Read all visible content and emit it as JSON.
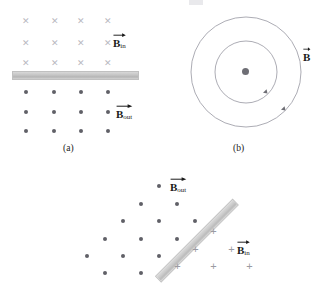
{
  "figure": {
    "background_color": "#ffffff",
    "width": 317,
    "height": 268
  },
  "colors": {
    "dot": "#606067",
    "cross": "#b9b9bf",
    "plus": "#9b9ba2",
    "bar": "#c4c4c4",
    "circle_stroke": "#9a9aa2",
    "text": "#1a1a1a"
  },
  "panels": [
    {
      "id": "a",
      "caption": "(a)",
      "description": "Straight horizontal conductor with field into page above and out of page below",
      "labels": [
        {
          "symbol": "B",
          "subscript": "in",
          "vector": true,
          "text": "B_in"
        },
        {
          "symbol": "B",
          "subscript": "out",
          "vector": true,
          "text": "B_out"
        }
      ],
      "field_into_page_rows": 3,
      "field_into_page_cols": 4,
      "field_out_of_page_rows": 3,
      "field_out_of_page_cols": 4,
      "conductor": {
        "orientation": "horizontal"
      }
    },
    {
      "id": "b",
      "caption": "(b)",
      "description": "Concentric circular field lines around a current-carrying wire pointing out of page",
      "labels": [
        {
          "symbol": "B",
          "subscript": "",
          "vector": true,
          "text": "B"
        }
      ],
      "circles": 2,
      "circle_radii": [
        58,
        33
      ],
      "direction": "clockwise",
      "center_marker": "dot"
    },
    {
      "id": "c",
      "caption": "",
      "description": "Tilted conductor at -45 degrees with field out of page on upper-left and into page on lower-right",
      "labels": [
        {
          "symbol": "B",
          "subscript": "out",
          "vector": true,
          "text": "B_out"
        },
        {
          "symbol": "B",
          "subscript": "in",
          "vector": true,
          "text": "B_in"
        }
      ],
      "conductor": {
        "orientation": "diagonal",
        "angle_degrees": -45
      }
    }
  ],
  "captions": {
    "a": "(a)",
    "b": "(b)"
  },
  "label_text": {
    "b_symbol": "B",
    "sub_in": "in",
    "sub_out": "out"
  }
}
